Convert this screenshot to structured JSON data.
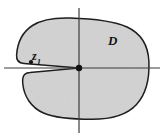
{
  "figure": {
    "kind": "complex-plane-slit-domain-diagram",
    "caption_labels": {
      "domain_label": "D",
      "point_label_base": "z",
      "point_label_subscript": "1"
    },
    "colors": {
      "region_fill": "#d2d2d2",
      "region_stroke": "#1e1e1e",
      "axis_stroke": "#3c3c3c",
      "point_marker": "#111111",
      "background": "#ffffff"
    },
    "geometry": {
      "canvas_width": 164,
      "canvas_height": 139,
      "origin_x": 79,
      "origin_y": 68,
      "x_axis_y": 68,
      "x_axis_x_start": 4,
      "x_axis_x_end": 160,
      "y_axis_x": 79,
      "y_axis_y_start": 8,
      "y_axis_y_end": 133,
      "region_left": 16,
      "region_right": 149,
      "region_top": 18,
      "region_bottom": 119,
      "slit_tip_x": 79,
      "slit_tip_y": 68,
      "slit_mouth_x": 16,
      "point_z1_x": 31,
      "point_z1_y": 62,
      "point_z1_radius": 2.1,
      "slit_tip_marker_radius": 3.2,
      "region_stroke_width": 1.5,
      "axis_stroke_width": 1.2
    }
  }
}
